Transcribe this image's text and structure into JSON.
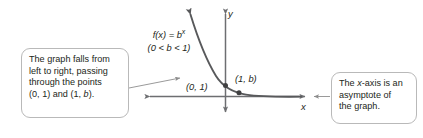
{
  "figure": {
    "function_label": {
      "equation_lhs": "f(x) = b",
      "equation_exponent": "x",
      "condition": "(0 < b < 1)"
    },
    "axes": {
      "x_label": "x",
      "y_label": "y"
    },
    "points": [
      {
        "name": "y-intercept",
        "label": "(0, 1)"
      },
      {
        "name": "point-at-x-equals-one",
        "label": "(1, b)"
      }
    ],
    "callouts": [
      {
        "id": "graph-behavior",
        "lines": [
          "The graph falls from",
          "left to right, passing",
          "through the points",
          "(0, 1) and (1, b)."
        ]
      },
      {
        "id": "asymptote-note",
        "lines": [
          "The x-axis is an",
          "asymptote of",
          "the graph."
        ]
      }
    ],
    "colors": {
      "curve": "#58595b",
      "axis": "#6d6e71",
      "callout_border": "#b9b9b9",
      "text": "#231f20",
      "leader_line": "#9a9a9a"
    }
  },
  "chart_data": {
    "type": "line",
    "xlabel": "x",
    "ylabel": "y",
    "grid": false,
    "legend": "none",
    "annotations": [
      "(0, 1)",
      "(1, b)"
    ],
    "marked_points": [
      {
        "x": 0,
        "y": 1,
        "label": "(0, 1)"
      },
      {
        "x": 1,
        "y": 0.38,
        "label": "(1, b)"
      }
    ],
    "series": [
      {
        "name": "f(x) = b^x",
        "x": [
          -1.55,
          -1.3,
          -1.05,
          -0.8,
          -0.55,
          -0.3,
          0,
          0.35,
          0.7,
          1,
          1.5,
          2.1,
          2.8,
          3.6,
          4.4
        ],
        "y": [
          10.9,
          7.3,
          4.9,
          3.3,
          2.2,
          1.5,
          1,
          0.66,
          0.47,
          0.38,
          0.24,
          0.15,
          0.09,
          0.05,
          0.03
        ]
      }
    ],
    "xlim": [
      -2.0,
      4.8
    ],
    "ylim": [
      -1.2,
      11.5
    ]
  }
}
